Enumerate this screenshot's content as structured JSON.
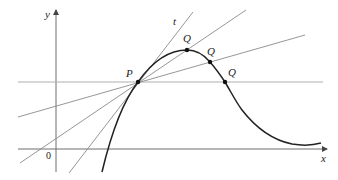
{
  "diagram": {
    "axes": {
      "x_label": "x",
      "y_label": "y",
      "origin_label": "0"
    },
    "labels": {
      "point_p": "P",
      "point_q1": "Q",
      "point_q2": "Q",
      "point_q3": "Q",
      "tangent": "t"
    },
    "colors": {
      "axis": "#6e6e6e",
      "curve": "#222222",
      "secant": "#8a8a8a",
      "horizontal_secant": "#b0b0b0",
      "point": "#111111"
    },
    "points": {
      "P": [
        138,
        82
      ],
      "Q1": [
        187,
        50
      ],
      "Q2": [
        210,
        62
      ],
      "Q3": [
        225,
        82
      ]
    }
  }
}
